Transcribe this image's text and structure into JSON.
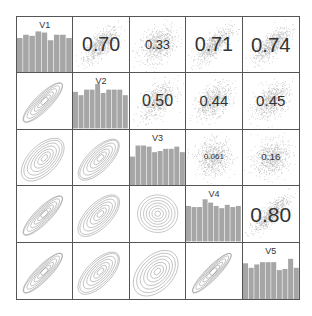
{
  "chart_data": {
    "type": "scatterplot-matrix",
    "title": "",
    "variables": [
      "V1",
      "V2",
      "V3",
      "V4",
      "V5"
    ],
    "upper_panel": "scatter with correlation coefficient (text size scaled by |r|)",
    "lower_panel": "2D density contours",
    "diagonal_panel": "histogram",
    "correlations": [
      {
        "row": "V1",
        "col": "V2",
        "r": 0.7,
        "label": "0.70"
      },
      {
        "row": "V1",
        "col": "V3",
        "r": 0.33,
        "label": "0.33"
      },
      {
        "row": "V1",
        "col": "V4",
        "r": 0.71,
        "label": "0.71"
      },
      {
        "row": "V1",
        "col": "V5",
        "r": 0.74,
        "label": "0.74"
      },
      {
        "row": "V2",
        "col": "V3",
        "r": 0.5,
        "label": "0.50"
      },
      {
        "row": "V2",
        "col": "V4",
        "r": 0.44,
        "label": "0.44"
      },
      {
        "row": "V2",
        "col": "V5",
        "r": 0.45,
        "label": "0.45"
      },
      {
        "row": "V3",
        "col": "V4",
        "r": 0.061,
        "label": "0.061"
      },
      {
        "row": "V3",
        "col": "V5",
        "r": 0.16,
        "label": "0.16"
      },
      {
        "row": "V4",
        "col": "V5",
        "r": 0.8,
        "label": "0.80"
      }
    ],
    "histograms": {
      "V1": [
        0.62,
        0.68,
        0.66,
        0.74,
        0.72,
        0.58,
        0.68,
        0.68,
        0.62
      ],
      "V2": [
        0.66,
        0.6,
        0.7,
        0.7,
        0.8,
        0.64,
        0.7,
        0.7,
        0.7,
        0.6
      ],
      "V3": [
        0.52,
        0.72,
        0.72,
        0.7,
        0.6,
        0.62,
        0.66,
        0.66,
        0.7,
        0.6
      ],
      "V4": [
        0.64,
        0.62,
        0.62,
        0.76,
        0.7,
        0.64,
        0.6,
        0.66,
        0.62,
        0.64
      ],
      "V5": [
        0.64,
        0.56,
        0.62,
        0.66,
        0.66,
        0.66,
        0.52,
        0.54,
        0.72,
        0.56
      ]
    },
    "grid": false,
    "legend": "none"
  },
  "colors": {
    "frame": "#555555",
    "bars": "#a6a6a6",
    "points": "#b5b5b5",
    "contours": "#8c8c8c",
    "text": "#333333"
  }
}
